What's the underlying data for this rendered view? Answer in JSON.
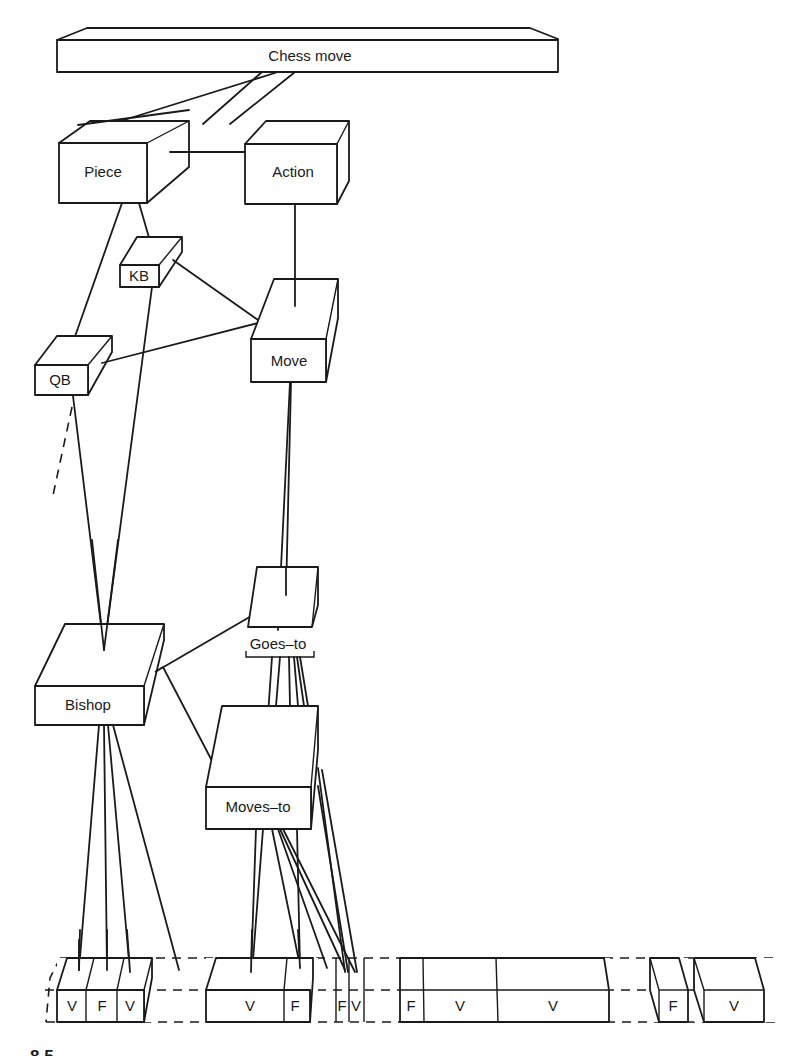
{
  "diagram": {
    "nodes": {
      "chess_move": "Chess move",
      "piece": "Piece",
      "action": "Action",
      "kb": "KB",
      "qb": "QB",
      "move": "Move",
      "bishop": "Bishop",
      "goes_to": "Goes–to",
      "moves_to": "Moves–to"
    },
    "bottom_cells": {
      "group1": [
        "V",
        "F",
        "V"
      ],
      "group2": [
        "V",
        "F"
      ],
      "group3": [
        "F",
        "V"
      ],
      "group4": [
        "F",
        "V",
        "V"
      ],
      "group5": [
        "F"
      ],
      "group6": [
        "V"
      ]
    },
    "edges": [
      [
        "Chess move",
        "Piece"
      ],
      [
        "Chess move",
        "Action"
      ],
      [
        "Piece",
        "Action"
      ],
      [
        "Piece",
        "KB"
      ],
      [
        "Piece",
        "QB"
      ],
      [
        "Action",
        "Move"
      ],
      [
        "KB",
        "Move"
      ],
      [
        "QB",
        "Move"
      ],
      [
        "KB",
        "Bishop"
      ],
      [
        "QB",
        "Bishop"
      ],
      [
        "Move",
        "Goes–to"
      ],
      [
        "Bishop",
        "Goes–to"
      ],
      [
        "Bishop",
        "Moves–to"
      ],
      [
        "Goes–to",
        "Moves–to"
      ]
    ],
    "figure_label_partial": "8.5"
  }
}
